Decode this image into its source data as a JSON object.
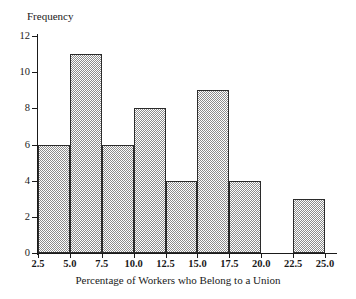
{
  "chart_data": {
    "type": "bar",
    "title": "",
    "subtitle": "",
    "xlabel": "Percentage of Workers who Belong to a Union",
    "ylabel": "Frequency",
    "categories": [
      "2.5-5.0",
      "5.0-7.5",
      "7.5-10.0",
      "10.0-12.5",
      "12.5-15.0",
      "15.0-17.5",
      "17.5-20.0",
      "20.0-22.5",
      "22.5-25.0"
    ],
    "bin_edges": [
      2.5,
      5.0,
      7.5,
      10.0,
      12.5,
      15.0,
      17.5,
      20.0,
      22.5,
      25.0
    ],
    "values": [
      6,
      11,
      6,
      8,
      4,
      9,
      4,
      0,
      3
    ],
    "bin_width": 2.5,
    "xlim": [
      2.5,
      25.0
    ],
    "ylim": [
      0,
      12
    ],
    "xticks": [
      2.5,
      5.0,
      7.5,
      10.0,
      12.5,
      15.0,
      17.5,
      20.0,
      22.5,
      25.0
    ],
    "xtick_labels": [
      "2.5",
      "5.0",
      "7.5",
      "10.0",
      "12.5",
      "15.0",
      "17.5",
      "20.0",
      "22.5",
      "25.0"
    ],
    "yticks": [
      0,
      2,
      4,
      6,
      8,
      10,
      12
    ],
    "ytick_labels": [
      "0",
      "2",
      "4",
      "6",
      "8",
      "10",
      "12"
    ],
    "grid": false,
    "legend": false,
    "legend_position": "none",
    "bar_fill": "#8d8d8d",
    "bar_edge_color": "#2b2b2b",
    "axis_color": "#1a1a1a",
    "background": "#ffffff",
    "total_frequency": 51
  },
  "axes": {
    "y_title": "Frequency",
    "x_title": "Percentage of Workers who Belong to a Union"
  }
}
